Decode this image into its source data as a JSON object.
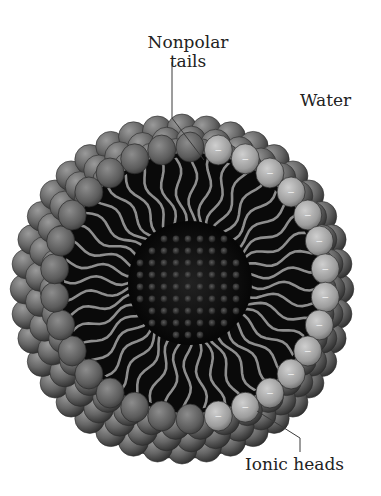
{
  "diagram": {
    "labels": {
      "tails_line1": "Nonpolar",
      "tails_line2": "tails",
      "water": "Water",
      "heads": "Ionic heads"
    },
    "head_charge_symbol": "−",
    "colors": {
      "background": "#ffffff",
      "outer_heads": "#6e6e6e",
      "cut_heads_light": "#a8a8a8",
      "interior": "#0b0b0b",
      "tails": "#8a8a8a",
      "core_dots": "#3a3a3a",
      "label_text": "#222222",
      "leader_line": "#333333"
    }
  }
}
